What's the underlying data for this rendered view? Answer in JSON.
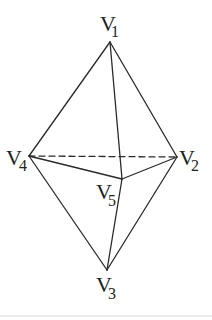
{
  "figure": {
    "type": "triangular-bipyramid",
    "vertices": [
      {
        "id": "V1",
        "letter": "V",
        "sub": "1",
        "x": 110,
        "y": 42,
        "label_x": 100,
        "label_y": 31,
        "sub_x": 111,
        "sub_y": 37
      },
      {
        "id": "V2",
        "letter": "V",
        "sub": "2",
        "x": 177,
        "y": 157,
        "label_x": 179,
        "label_y": 165,
        "sub_x": 191,
        "sub_y": 171
      },
      {
        "id": "V3",
        "letter": "V",
        "sub": "3",
        "x": 107,
        "y": 270,
        "label_x": 96,
        "label_y": 292,
        "sub_x": 108,
        "sub_y": 299
      },
      {
        "id": "V4",
        "letter": "V",
        "sub": "4",
        "x": 29,
        "y": 156,
        "label_x": 6,
        "label_y": 165,
        "sub_x": 19,
        "sub_y": 171
      },
      {
        "id": "V5",
        "letter": "V",
        "sub": "5",
        "x": 122,
        "y": 179,
        "label_x": 96,
        "label_y": 199,
        "sub_x": 108,
        "sub_y": 206
      }
    ],
    "edges": [
      {
        "from": "V1",
        "to": "V2",
        "style": "solid"
      },
      {
        "from": "V1",
        "to": "V4",
        "style": "solid"
      },
      {
        "from": "V1",
        "to": "V5",
        "style": "solid"
      },
      {
        "from": "V3",
        "to": "V2",
        "style": "solid"
      },
      {
        "from": "V3",
        "to": "V4",
        "style": "solid"
      },
      {
        "from": "V3",
        "to": "V5",
        "style": "solid"
      },
      {
        "from": "V4",
        "to": "V5",
        "style": "solid"
      },
      {
        "from": "V5",
        "to": "V2",
        "style": "solid"
      },
      {
        "from": "V4",
        "to": "V2",
        "style": "dashed"
      }
    ]
  },
  "labels": {
    "v1": {
      "letter": "V",
      "sub": "1"
    },
    "v2": {
      "letter": "V",
      "sub": "2"
    },
    "v3": {
      "letter": "V",
      "sub": "3"
    },
    "v4": {
      "letter": "V",
      "sub": "4"
    },
    "v5": {
      "letter": "V",
      "sub": "5"
    }
  },
  "colors": {
    "line": "#2a2a2a",
    "text": "#1e1e1e",
    "background": "#ffffff"
  }
}
